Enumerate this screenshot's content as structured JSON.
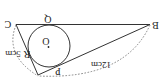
{
  "diagram": {
    "orientation": "rotated-180",
    "vertices": {
      "C": "C",
      "B": "B",
      "A": ""
    },
    "tangent_points": {
      "Q": "Q",
      "R": "R",
      "P": "P"
    },
    "center_label": "O",
    "measurements": {
      "side_CA": "5cm",
      "side_AB": "12cm"
    },
    "colors": {
      "line": "#333333",
      "dashed": "#777777",
      "text": "#222222",
      "background": "#ffffff"
    }
  }
}
